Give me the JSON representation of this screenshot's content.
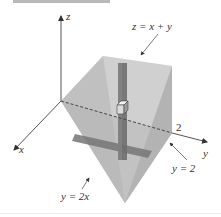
{
  "figure": {
    "axes": {
      "x_label": "x",
      "y_label": "y",
      "z_label": "z",
      "y_tick_label": "2"
    },
    "annotations": {
      "top_plane": "z = x + y",
      "slanted_plane": "y = 2x",
      "side_plane": "y = 2"
    },
    "colors": {
      "axis": "#555555",
      "face_light": "#d6d6d6",
      "face_mid": "#b8b8b8",
      "face_dark": "#9a9a9a",
      "column": "#6e6e6e",
      "band": "#767676"
    }
  }
}
